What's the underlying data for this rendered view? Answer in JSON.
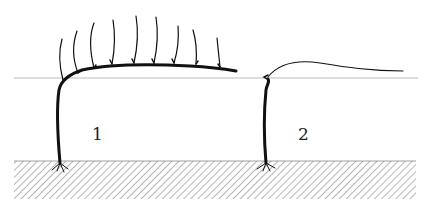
{
  "diagram": {
    "type": "vine training comparison",
    "colors": {
      "stroke": "#111111",
      "wire": "#999999",
      "hatch": "#777777",
      "background": "#ffffff"
    },
    "figures": [
      {
        "id": "1",
        "label": "1",
        "description": "trunk with arched cordon and vertical shoots"
      },
      {
        "id": "2",
        "label": "2",
        "description": "trunk with single arching cane"
      }
    ]
  }
}
